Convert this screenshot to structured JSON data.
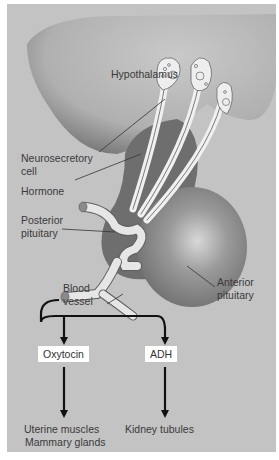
{
  "figure": {
    "labels": {
      "hypothalamus": "Hypothalamus",
      "neurosecretory_cell_line1": "Neurosecretory",
      "neurosecretory_cell_line2": "cell",
      "hormone": "Hormone",
      "posterior_pituitary_line1": "Posterior",
      "posterior_pituitary_line2": "pituitary",
      "blood_vessel_line1": "Blood",
      "blood_vessel_line2": "vessel",
      "anterior_pituitary_line1": "Anterior",
      "anterior_pituitary_line2": "pituitary"
    },
    "hormones": [
      {
        "name": "Oxytocin",
        "targets": [
          "Uterine muscles",
          "Mammary glands"
        ]
      },
      {
        "name": "ADH",
        "targets": [
          "Kidney tubules"
        ]
      }
    ],
    "colors": {
      "background": "#c3c3c3",
      "tissue_dark": "#6e6e6e",
      "tissue_light": "#8a8a8a",
      "vessel": "#e6e6e6",
      "arrow": "#111111"
    }
  }
}
